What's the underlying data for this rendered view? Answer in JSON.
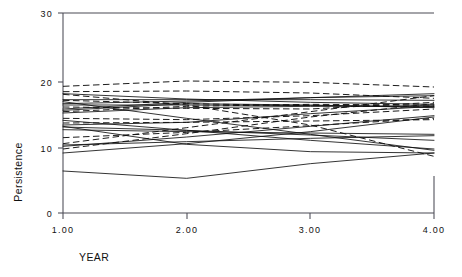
{
  "chart_data": {
    "type": "line",
    "title": "",
    "subtitle": "",
    "xlabel": "YEAR",
    "ylabel": "Persistence",
    "x": [
      1.0,
      2.0,
      3.0,
      4.0
    ],
    "xtick_labels": [
      "1.00",
      "2.00",
      "3.00",
      "4.00"
    ],
    "ytick_labels": [
      "0",
      "10",
      "20",
      "30"
    ],
    "ytick_values": [
      0,
      10,
      20,
      30
    ],
    "xlim": [
      1.0,
      4.0
    ],
    "ylim": [
      0,
      30
    ],
    "grid": false,
    "legend": "none",
    "annotations": [],
    "series": [
      {
        "name": "case-01",
        "style": "dashed",
        "values": [
          19.0,
          19.8,
          19.6,
          18.9
        ]
      },
      {
        "name": "case-02",
        "style": "dashed",
        "values": [
          18.2,
          18.3,
          18.0,
          17.2
        ]
      },
      {
        "name": "case-03",
        "style": "solid",
        "values": [
          17.9,
          17.1,
          16.6,
          16.3
        ]
      },
      {
        "name": "case-04",
        "style": "solid",
        "values": [
          17.0,
          17.0,
          17.0,
          16.9
        ]
      },
      {
        "name": "case-05",
        "style": "dashed",
        "values": [
          16.9,
          16.4,
          16.1,
          16.0
        ]
      },
      {
        "name": "case-06",
        "style": "solid",
        "values": [
          16.4,
          16.8,
          17.3,
          17.6
        ]
      },
      {
        "name": "case-07",
        "style": "solid",
        "values": [
          16.2,
          16.2,
          16.1,
          15.9
        ]
      },
      {
        "name": "case-08",
        "style": "dashed",
        "values": [
          15.9,
          15.7,
          15.6,
          16.6
        ]
      },
      {
        "name": "case-09",
        "style": "solid",
        "values": [
          15.6,
          16.6,
          17.3,
          17.9
        ]
      },
      {
        "name": "case-10",
        "style": "solid",
        "values": [
          15.4,
          16.4,
          16.2,
          15.8
        ]
      },
      {
        "name": "case-11",
        "style": "dashed",
        "values": [
          15.2,
          16.0,
          16.3,
          16.2
        ]
      },
      {
        "name": "case-12",
        "style": "solid",
        "values": [
          15.0,
          15.8,
          16.0,
          16.1
        ]
      },
      {
        "name": "case-13",
        "style": "dashed",
        "values": [
          14.2,
          14.0,
          14.6,
          15.6
        ]
      },
      {
        "name": "case-14",
        "style": "dashed",
        "values": [
          13.5,
          13.6,
          13.8,
          14.0
        ]
      },
      {
        "name": "case-15",
        "style": "solid",
        "values": [
          13.2,
          13.6,
          14.9,
          16.0
        ]
      },
      {
        "name": "case-16",
        "style": "solid",
        "values": [
          12.9,
          12.4,
          11.7,
          10.9
        ]
      },
      {
        "name": "case-17",
        "style": "solid",
        "values": [
          12.5,
          12.2,
          12.0,
          11.8
        ]
      },
      {
        "name": "case-18",
        "style": "dashed",
        "values": [
          11.3,
          12.1,
          13.1,
          14.2
        ]
      },
      {
        "name": "case-19",
        "style": "dashed",
        "values": [
          10.4,
          12.8,
          15.2,
          17.6
        ]
      },
      {
        "name": "case-20",
        "style": "solid",
        "values": [
          10.2,
          10.7,
          11.2,
          11.6
        ]
      },
      {
        "name": "case-21",
        "style": "solid",
        "values": [
          10.0,
          11.4,
          13.0,
          14.6
        ]
      },
      {
        "name": "case-22",
        "style": "dashed",
        "values": [
          9.6,
          11.9,
          14.4,
          16.4
        ]
      },
      {
        "name": "case-23",
        "style": "solid",
        "values": [
          9.0,
          10.4,
          12.2,
          14.4
        ]
      },
      {
        "name": "case-24",
        "style": "solid",
        "values": [
          16.7,
          14.2,
          11.8,
          9.4
        ]
      },
      {
        "name": "case-25",
        "style": "dashed",
        "values": [
          17.8,
          16.2,
          13.2,
          8.5
        ]
      },
      {
        "name": "case-26",
        "style": "solid",
        "values": [
          13.9,
          12.4,
          10.9,
          9.6
        ]
      },
      {
        "name": "case-27",
        "style": "solid",
        "values": [
          13.0,
          10.3,
          9.2,
          9.0
        ]
      },
      {
        "name": "case-28",
        "style": "solid",
        "values": [
          6.3,
          5.2,
          7.4,
          9.0
        ]
      }
    ]
  },
  "axes": {
    "y_title": "Persistence",
    "x_title": "YEAR"
  }
}
